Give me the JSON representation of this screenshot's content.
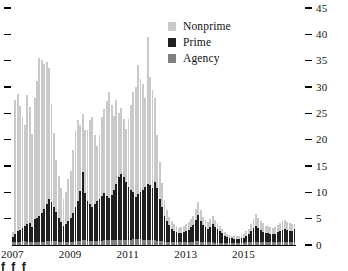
{
  "chart_data": {
    "type": "bar",
    "stacked": true,
    "title": "",
    "subtitle": "",
    "xlabel": "",
    "ylabel": "",
    "ylim": [
      0,
      45
    ],
    "yticks": [
      0,
      5,
      10,
      15,
      20,
      25,
      30,
      35,
      40,
      45
    ],
    "ytick_labels": [
      "0",
      "5",
      "10",
      "15",
      "20",
      "25",
      "30",
      "35",
      "40",
      "45"
    ],
    "y_axis_position": "right",
    "left_axis_ticks_unlabeled": true,
    "grid": false,
    "legend_position": "top-center",
    "xtick_labels": [
      "2007",
      "2009",
      "2011",
      "2013",
      "2015"
    ],
    "xtick_index": [
      0,
      24,
      48,
      72,
      96
    ],
    "x_period_start": "2007-01",
    "x_period_end": "2016-10",
    "x_frequency": "monthly",
    "categories": [
      "2007-01",
      "2007-02",
      "2007-03",
      "2007-04",
      "2007-05",
      "2007-06",
      "2007-07",
      "2007-08",
      "2007-09",
      "2007-10",
      "2007-11",
      "2007-12",
      "2008-01",
      "2008-02",
      "2008-03",
      "2008-04",
      "2008-05",
      "2008-06",
      "2008-07",
      "2008-08",
      "2008-09",
      "2008-10",
      "2008-11",
      "2008-12",
      "2009-01",
      "2009-02",
      "2009-03",
      "2009-04",
      "2009-05",
      "2009-06",
      "2009-07",
      "2009-08",
      "2009-09",
      "2009-10",
      "2009-11",
      "2009-12",
      "2010-01",
      "2010-02",
      "2010-03",
      "2010-04",
      "2010-05",
      "2010-06",
      "2010-07",
      "2010-08",
      "2010-09",
      "2010-10",
      "2010-11",
      "2010-12",
      "2011-01",
      "2011-02",
      "2011-03",
      "2011-04",
      "2011-05",
      "2011-06",
      "2011-07",
      "2011-08",
      "2011-09",
      "2011-10",
      "2011-11",
      "2011-12",
      "2012-01",
      "2012-02",
      "2012-03",
      "2012-04",
      "2012-05",
      "2012-06",
      "2012-07",
      "2012-08",
      "2012-09",
      "2012-10",
      "2012-11",
      "2012-12",
      "2013-01",
      "2013-02",
      "2013-03",
      "2013-04",
      "2013-05",
      "2013-06",
      "2013-07",
      "2013-08",
      "2013-09",
      "2013-10",
      "2013-11",
      "2013-12",
      "2014-01",
      "2014-02",
      "2014-03",
      "2014-04",
      "2014-05",
      "2014-06",
      "2014-07",
      "2014-08",
      "2014-09",
      "2014-10",
      "2014-11",
      "2014-12",
      "2015-01",
      "2015-02",
      "2015-03",
      "2015-04",
      "2015-05",
      "2015-06",
      "2015-07",
      "2015-08",
      "2015-09",
      "2015-10",
      "2015-11",
      "2015-12",
      "2016-01",
      "2016-02",
      "2016-03",
      "2016-04",
      "2016-05",
      "2016-06",
      "2016-07",
      "2016-08",
      "2016-09",
      "2016-10"
    ],
    "series": [
      {
        "name": "Agency",
        "color": "#808080",
        "values": [
          0.5,
          0.5,
          0.6,
          0.6,
          0.7,
          0.7,
          0.6,
          0.6,
          0.5,
          0.6,
          0.6,
          0.6,
          0.6,
          0.6,
          0.7,
          0.7,
          0.7,
          0.8,
          0.7,
          0.6,
          0.6,
          0.5,
          0.5,
          0.5,
          0.6,
          0.6,
          0.7,
          0.8,
          0.8,
          0.9,
          0.9,
          0.8,
          0.8,
          0.8,
          0.8,
          0.8,
          0.8,
          0.8,
          0.9,
          0.9,
          1.0,
          1.0,
          1.0,
          1.0,
          1.0,
          1.0,
          1.0,
          1.0,
          1.0,
          1.0,
          1.1,
          1.1,
          1.1,
          1.1,
          1.0,
          1.0,
          1.0,
          0.9,
          0.9,
          0.9,
          0.8,
          0.7,
          0.7,
          0.6,
          0.6,
          0.6,
          0.5,
          0.5,
          0.5,
          0.5,
          0.5,
          0.5,
          0.5,
          0.5,
          0.6,
          0.6,
          0.7,
          0.7,
          0.6,
          0.6,
          0.6,
          0.5,
          0.5,
          0.5,
          0.4,
          0.4,
          0.4,
          0.4,
          0.4,
          0.4,
          0.4,
          0.4,
          0.4,
          0.4,
          0.4,
          0.4,
          0.4,
          0.5,
          0.5,
          0.6,
          0.6,
          0.6,
          0.6,
          0.6,
          0.5,
          0.5,
          0.5,
          0.5,
          0.5,
          0.5,
          0.6,
          0.6,
          0.6,
          0.6,
          0.6,
          0.6,
          0.5,
          0.5
        ]
      },
      {
        "name": "Prime",
        "color": "#1f1f1f",
        "values": [
          1.0,
          1.5,
          2.0,
          2.3,
          2.6,
          3.0,
          3.3,
          3.6,
          3.0,
          4.3,
          4.6,
          5.0,
          5.5,
          6.2,
          7.0,
          8.0,
          7.5,
          6.5,
          5.5,
          4.5,
          3.8,
          3.2,
          3.5,
          4.0,
          4.5,
          5.5,
          6.5,
          7.5,
          9.5,
          13.0,
          9.0,
          7.5,
          7.0,
          6.5,
          7.0,
          7.5,
          8.0,
          8.5,
          9.0,
          8.5,
          8.0,
          8.5,
          9.5,
          10.5,
          12.0,
          12.5,
          12.0,
          11.0,
          10.0,
          9.5,
          9.0,
          8.0,
          8.5,
          9.0,
          9.5,
          10.0,
          10.5,
          10.5,
          10.0,
          11.0,
          10.0,
          8.0,
          6.5,
          5.0,
          4.0,
          3.2,
          2.6,
          2.2,
          2.0,
          1.8,
          1.8,
          2.0,
          2.2,
          2.4,
          2.8,
          3.2,
          4.0,
          5.0,
          4.0,
          3.2,
          2.8,
          2.6,
          3.0,
          3.4,
          3.0,
          2.6,
          2.2,
          1.8,
          1.4,
          1.2,
          1.0,
          0.9,
          0.8,
          0.8,
          0.8,
          0.9,
          1.0,
          1.2,
          1.5,
          2.0,
          2.6,
          3.0,
          2.6,
          2.2,
          2.0,
          1.8,
          1.8,
          1.6,
          1.5,
          1.6,
          1.8,
          2.0,
          2.2,
          2.4,
          2.2,
          2.0,
          2.2,
          2.5
        ]
      },
      {
        "name": "Nonprime",
        "color": "#c9c9c9",
        "values": [
          1.0,
          25.5,
          26.0,
          23.5,
          21.0,
          19.0,
          24.5,
          22.0,
          17.5,
          23.0,
          26.0,
          30.0,
          29.0,
          27.5,
          27.0,
          25.0,
          18.5,
          14.0,
          10.0,
          8.0,
          6.5,
          5.0,
          6.0,
          8.0,
          9.0,
          12.0,
          14.5,
          15.5,
          12.5,
          11.0,
          12.0,
          13.5,
          16.0,
          17.0,
          13.0,
          10.5,
          12.0,
          15.0,
          16.0,
          18.0,
          20.0,
          17.0,
          14.0,
          16.0,
          12.0,
          12.5,
          11.0,
          10.0,
          13.0,
          16.0,
          19.0,
          21.0,
          24.5,
          21.5,
          20.0,
          17.0,
          28.0,
          20.5,
          18.5,
          16.0,
          10.0,
          7.0,
          4.5,
          3.0,
          2.0,
          1.6,
          1.4,
          1.2,
          1.1,
          1.0,
          1.1,
          1.2,
          1.3,
          1.4,
          1.6,
          1.8,
          2.2,
          2.5,
          2.0,
          1.6,
          1.4,
          1.3,
          1.5,
          1.7,
          1.4,
          1.2,
          1.0,
          0.8,
          0.6,
          0.5,
          0.5,
          0.5,
          0.5,
          0.5,
          0.5,
          0.6,
          0.7,
          0.9,
          1.1,
          1.4,
          1.8,
          2.2,
          2.0,
          1.8,
          1.6,
          1.4,
          1.4,
          1.3,
          1.2,
          1.3,
          1.4,
          1.5,
          1.7,
          1.8,
          1.6,
          1.5,
          1.3,
          1.0
        ]
      }
    ]
  },
  "legend": {
    "items": [
      {
        "label": "Nonprime",
        "color": "#c9c9c9"
      },
      {
        "label": "Prime",
        "color": "#1f1f1f"
      },
      {
        "label": "Agency",
        "color": "#808080"
      }
    ]
  },
  "caption_fragment": "f f f"
}
